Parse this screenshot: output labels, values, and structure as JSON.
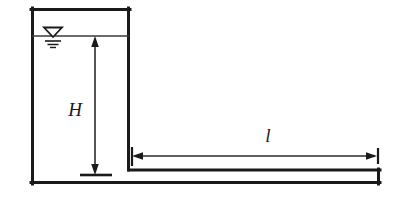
{
  "diagram": {
    "type": "engineering-schematic",
    "colors": {
      "background": "#ffffff",
      "stroke": "#1a1a1a",
      "dimension": "#2b2b2b"
    },
    "labels": {
      "head": "H",
      "pipe_length": "l"
    },
    "elements": {
      "tank_name": "reservoir-tank",
      "pipe_name": "outlet-pipe",
      "water_surface_name": "water-surface-symbol",
      "head_dimension_name": "head-dimension",
      "length_dimension_name": "pipe-length-dimension"
    },
    "geometry": {
      "tank": {
        "left": 31,
        "top": 8,
        "right": 130,
        "bottom": 184
      },
      "water_line_y": 36,
      "pipe": {
        "left": 130,
        "right": 380,
        "top": 169,
        "bottom": 183
      },
      "head_arrow": {
        "x": 95,
        "top": 37,
        "bottom": 174
      },
      "length_arrow": {
        "y": 156,
        "left": 133,
        "right": 378
      }
    }
  }
}
